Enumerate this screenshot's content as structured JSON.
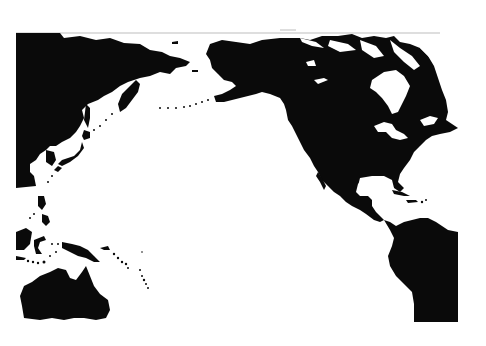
{
  "map": {
    "type": "pacific-rim-silhouette",
    "style": "black land on white ocean, scanned print",
    "colors": {
      "land": "#0a0a0a",
      "ocean": "#ffffff",
      "frame": "#bdbdbd"
    },
    "regions": [
      {
        "id": "east-asia",
        "label": ""
      },
      {
        "id": "kamchatka",
        "label": ""
      },
      {
        "id": "japan",
        "label": ""
      },
      {
        "id": "alaska",
        "label": ""
      },
      {
        "id": "canada",
        "label": ""
      },
      {
        "id": "greenland-edge",
        "label": ""
      },
      {
        "id": "usa",
        "label": ""
      },
      {
        "id": "mexico-central-america",
        "label": ""
      },
      {
        "id": "caribbean",
        "label": ""
      },
      {
        "id": "south-america",
        "label": ""
      },
      {
        "id": "philippines",
        "label": ""
      },
      {
        "id": "indonesia",
        "label": ""
      },
      {
        "id": "new-guinea",
        "label": ""
      },
      {
        "id": "australia",
        "label": ""
      },
      {
        "id": "pacific-islands",
        "label": ""
      }
    ]
  }
}
